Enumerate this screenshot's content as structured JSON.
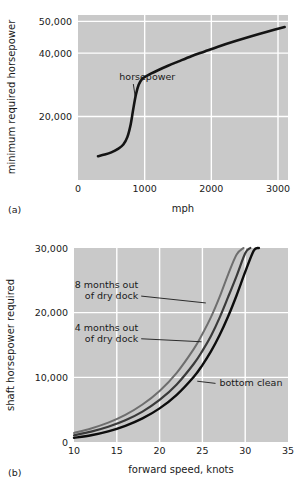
{
  "figure": {
    "background_color": "#ffffff",
    "plot_background_color": "#c9c9c9",
    "gridline_color": "#ffffff"
  },
  "panel_a": {
    "tag": "(a)",
    "chart_data": {
      "type": "line",
      "title": "",
      "xlabel": "mph",
      "ylabel": "minimum required horsepower",
      "xlim": [
        0,
        3150
      ],
      "ylim": [
        0,
        52000
      ],
      "xticks": [
        0,
        1000,
        2000,
        3000
      ],
      "xtick_labels": [
        "0",
        "1000",
        "2000",
        "3000"
      ],
      "yticks": [
        20000,
        40000,
        50000
      ],
      "ytick_labels": [
        "20,000",
        "40,000",
        "50,000"
      ],
      "grid": true,
      "legend": "none",
      "annotations": [
        {
          "text": "horsepower",
          "x": 620,
          "y": 31500,
          "points_to_x": 860,
          "points_to_y": 26000
        }
      ],
      "series": [
        {
          "name": "horsepower",
          "color": "#141414",
          "line_width": 2.6,
          "x": [
            300,
            400,
            500,
            600,
            680,
            740,
            790,
            830,
            870,
            910,
            960,
            1020,
            1100,
            1200,
            1350,
            1500,
            1700,
            1900,
            2100,
            2350,
            2600,
            2850,
            3100
          ],
          "y": [
            7500,
            8000,
            8700,
            9800,
            11200,
            13500,
            17500,
            22500,
            27000,
            30000,
            31800,
            32700,
            33600,
            34600,
            36000,
            37300,
            39000,
            40500,
            42000,
            43700,
            45300,
            46800,
            48200
          ]
        }
      ]
    }
  },
  "panel_b": {
    "tag": "(b)",
    "chart_data": {
      "type": "line",
      "title": "",
      "xlabel": "forward speed, knots",
      "ylabel": "shaft horsepower required",
      "xlim": [
        10,
        35
      ],
      "ylim": [
        0,
        30000
      ],
      "xticks": [
        10,
        15,
        20,
        25,
        30,
        35
      ],
      "xtick_labels": [
        "10",
        "15",
        "20",
        "25",
        "30",
        "35"
      ],
      "yticks": [
        0,
        10000,
        20000,
        30000
      ],
      "ytick_labels": [
        "0",
        "10,000",
        "20,000",
        "30,000"
      ],
      "grid": true,
      "legend": "inline-annotations",
      "annotations": [
        {
          "text_line1": "8 months out",
          "text_line2": "of dry dock",
          "x": 17.5,
          "y": 23800,
          "points_to_x": 25.4,
          "points_to_y": 21500
        },
        {
          "text_line1": "4 months out",
          "text_line2": "of dry dock",
          "x": 17.5,
          "y": 17200,
          "points_to_x": 24.9,
          "points_to_y": 15500
        },
        {
          "text_line1": "bottom clean",
          "text_line2": "",
          "x": 27.0,
          "y": 8600,
          "points_to_x": 24.4,
          "points_to_y": 9400
        }
      ],
      "series": [
        {
          "name": "8 months out of dry dock",
          "color": "#6e6e6e",
          "line_width": 2.0,
          "x": [
            10,
            12,
            14,
            16,
            18,
            20,
            22,
            24,
            25,
            26,
            27,
            28,
            29,
            29.8
          ],
          "y": [
            1400,
            2100,
            3000,
            4200,
            5800,
            7900,
            10700,
            14400,
            16700,
            19300,
            22400,
            25900,
            29000,
            30000
          ]
        },
        {
          "name": "4 months out of dry dock",
          "color": "#3a3a3a",
          "line_width": 2.2,
          "x": [
            10,
            12,
            14,
            16,
            18,
            20,
            22,
            24,
            25,
            26,
            27,
            28,
            29,
            30,
            30.6
          ],
          "y": [
            1050,
            1600,
            2350,
            3350,
            4700,
            6500,
            8900,
            12100,
            14100,
            16400,
            19200,
            22400,
            25700,
            29200,
            30000
          ]
        },
        {
          "name": "bottom clean",
          "color": "#0d0d0d",
          "line_width": 2.4,
          "x": [
            10,
            12,
            14,
            16,
            18,
            20,
            22,
            24,
            25,
            26,
            27,
            28,
            29,
            30,
            31,
            31.6
          ],
          "y": [
            650,
            1050,
            1650,
            2500,
            3650,
            5200,
            7300,
            10100,
            11900,
            14000,
            16500,
            19400,
            22700,
            26300,
            29600,
            30000
          ]
        }
      ]
    }
  }
}
